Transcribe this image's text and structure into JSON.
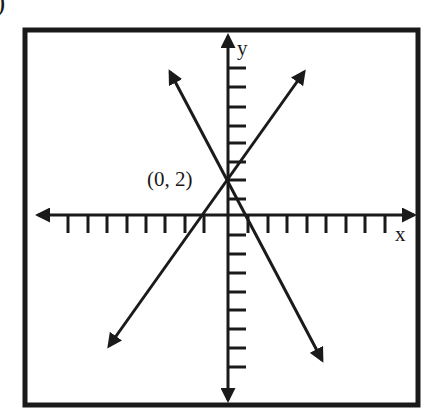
{
  "figure": {
    "part_marker": ")",
    "axes": {
      "x_label": "x",
      "y_label": "y",
      "x_ticks_each_side": 8,
      "y_ticks_each_side": 8
    },
    "point": {
      "label": "(0, 2)",
      "x": 0,
      "y": 2
    },
    "lines": [
      {
        "name": "positive-slope-line",
        "passes_through": "(0, 2)",
        "slope_sign": "positive"
      },
      {
        "name": "negative-slope-line",
        "passes_through": "(0, 2)",
        "slope_sign": "negative"
      }
    ],
    "colors": {
      "ink": "#1a1a1a",
      "background": "#ffffff"
    }
  }
}
